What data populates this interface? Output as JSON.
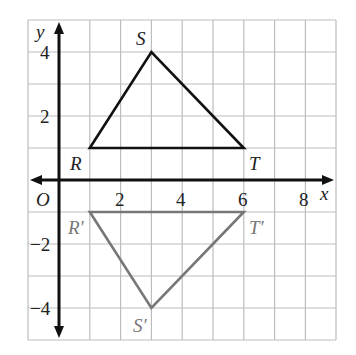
{
  "axes": {
    "x_label": "x",
    "y_label": "y",
    "origin_label": "O",
    "x_ticks": [
      {
        "value": 2,
        "label": "2"
      },
      {
        "value": 4,
        "label": "4"
      },
      {
        "value": 6,
        "label": "6"
      },
      {
        "value": 8,
        "label": "8"
      }
    ],
    "y_ticks": [
      {
        "value": 4,
        "label": "4"
      },
      {
        "value": 2,
        "label": "2"
      },
      {
        "value": -2,
        "label": "−2"
      },
      {
        "value": -4,
        "label": "−4"
      }
    ],
    "x_range": [
      -1,
      9
    ],
    "y_range": [
      -5,
      5
    ]
  },
  "triangles": {
    "original": {
      "color": "#111111",
      "vertices": [
        {
          "name": "R",
          "x": 1,
          "y": 1
        },
        {
          "name": "S",
          "x": 3,
          "y": 4
        },
        {
          "name": "T",
          "x": 6,
          "y": 1
        }
      ]
    },
    "image": {
      "color": "#777777",
      "vertices": [
        {
          "name": "R′",
          "x": 1,
          "y": -1
        },
        {
          "name": "S′",
          "x": 3,
          "y": -4
        },
        {
          "name": "T′",
          "x": 6,
          "y": -1
        }
      ]
    }
  },
  "labels": {
    "R": "R",
    "S": "S",
    "T": "T",
    "R_prime": "R′",
    "S_prime": "S′",
    "T_prime": "T′"
  },
  "colors": {
    "grid": "#bdbdbd",
    "axis": "#111111",
    "original": "#111111",
    "image": "#777777"
  }
}
